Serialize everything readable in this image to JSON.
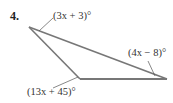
{
  "problem": {
    "number": "4."
  },
  "figure": {
    "type": "triangle",
    "stroke_color": "#777777",
    "vertices": {
      "left": {
        "x": 29,
        "y": 27
      },
      "bottom": {
        "x": 80,
        "y": 79
      },
      "right": {
        "x": 167,
        "y": 79
      }
    },
    "angles": [
      {
        "vertex": "left",
        "label": "(3x + 3)°"
      },
      {
        "vertex": "right",
        "label": "(4x − 8)°"
      },
      {
        "vertex": "bottom",
        "label": "(13x + 45)°"
      }
    ]
  }
}
